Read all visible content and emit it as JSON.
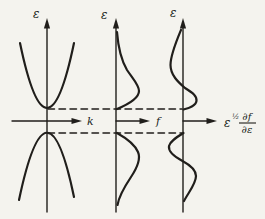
{
  "figure": {
    "colors": {
      "ink": "#201e1b",
      "paper": "#f4f3ee"
    },
    "panels": [
      {
        "id": "band-structure",
        "y_axis_label": "ε",
        "x_axis_label": "k",
        "curves": [
          "conduction-band-parabola-opening-up",
          "valence-band-parabola-opening-down"
        ]
      },
      {
        "id": "distribution-function",
        "y_axis_label": "ε",
        "x_axis_label": "f",
        "curves": [
          "electron-distribution-bulge-above-band-edge",
          "hole-distribution-bulge-below-band-edge"
        ]
      },
      {
        "id": "weighted-derivative",
        "y_axis_label": "ε",
        "x_axis_label_base": "ε",
        "x_axis_label_sup": "½",
        "x_axis_label_frac_num": "∂f",
        "x_axis_label_frac_den": "∂ε",
        "curves": [
          "s-curve-above-band-edge",
          "s-curve-below-band-edge"
        ]
      }
    ],
    "guides": {
      "upper_band_edge_line": "dashed",
      "lower_band_edge_line": "dashed"
    }
  }
}
